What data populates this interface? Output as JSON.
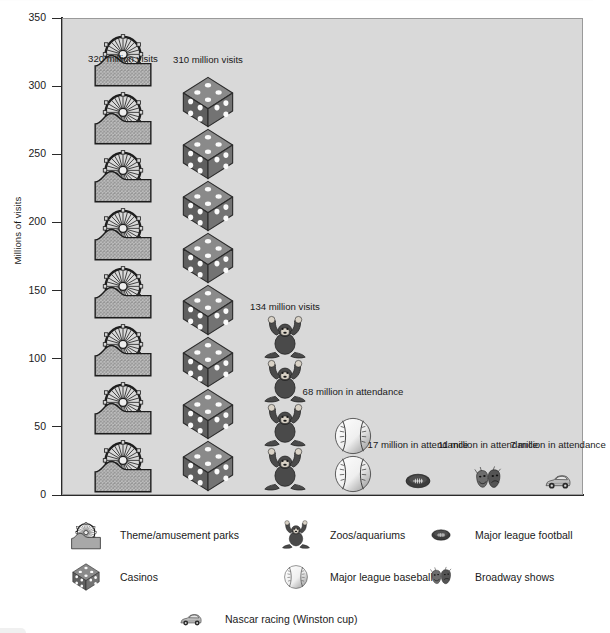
{
  "chart_data": {
    "type": "bar",
    "subtype": "pictograph",
    "title": "",
    "xlabel": "",
    "ylabel": "Millions of visits",
    "ylim": [
      0,
      350
    ],
    "yticks": [
      0,
      50,
      100,
      150,
      200,
      250,
      300,
      350
    ],
    "ytick_labels": [
      "0",
      "50",
      "100",
      "150",
      "200",
      "250",
      "300",
      "350"
    ],
    "grid": false,
    "legend_position": "bottom",
    "units_per_symbol": 40,
    "categories": [
      "Theme/amusement parks",
      "Casinos",
      "Zoos/aquariums",
      "Major league baseball",
      "Major league football",
      "Broadway shows",
      "Nascar racing (Winston cup)"
    ],
    "values": [
      320,
      310,
      134,
      68,
      17,
      11,
      7
    ],
    "value_labels": [
      "320 million visits",
      "310 million visits",
      "134 million visits",
      "68 million in attendance",
      "17 million in attendance",
      "11 million in attendance",
      "7 million in attendance"
    ],
    "series": [
      {
        "name": "Attendance",
        "values": [
          320,
          310,
          134,
          68,
          17,
          11,
          7
        ]
      }
    ]
  },
  "plot": {
    "background_color": "#d9d9d9",
    "axis_color": "#2a2a2a",
    "columns": [
      {
        "key": "theme-parks",
        "label": "320 million visits",
        "icon": "ferris-wheel-icon",
        "value": 320,
        "symbols": 8,
        "label_top_px": 52
      },
      {
        "key": "casinos",
        "label": "310 million visits",
        "icon": "dice-icon",
        "value": 310,
        "symbols": 8,
        "label_top_px": 53
      },
      {
        "key": "zoos",
        "label": "134 million visits",
        "icon": "gorilla-icon",
        "value": 134,
        "symbols": 4,
        "label_top_px": 300
      },
      {
        "key": "baseball",
        "label": "68 million in attendance",
        "icon": "baseball-icon",
        "value": 68,
        "symbols": 2,
        "label_top_px": 385
      },
      {
        "key": "football",
        "label": "17 million in attendance",
        "icon": "football-icon",
        "value": 17,
        "symbols": 1,
        "label_top_px": 438
      },
      {
        "key": "broadway",
        "label": "11 million in attendance",
        "icon": "theater-masks-icon",
        "value": 11,
        "symbols": 1,
        "label_top_px": 438
      },
      {
        "key": "nascar",
        "label": "7 million in attendance",
        "icon": "race-car-icon",
        "value": 7,
        "symbols": 1,
        "label_top_px": 438
      }
    ]
  },
  "legend": {
    "rows": [
      [
        {
          "icon": "ferris-wheel-icon",
          "label": "Theme/amusement parks"
        },
        {
          "icon": "gorilla-icon",
          "label": "Zoos/aquariums"
        },
        {
          "icon": "football-icon",
          "label": "Major league football"
        }
      ],
      [
        {
          "icon": "dice-icon",
          "label": "Casinos"
        },
        {
          "icon": "baseball-icon",
          "label": "Major league baseball"
        },
        {
          "icon": "theater-masks-icon",
          "label": "Broadway shows"
        }
      ],
      [
        {
          "icon": "race-car-icon",
          "label": "Nascar racing (Winston cup)"
        }
      ]
    ]
  },
  "colors": {
    "plot_background": "#d9d9d9",
    "page_background": "#ffffff",
    "ink": "#1a1a1a",
    "icon_dark": "#555555",
    "icon_mid": "#7d7d7d",
    "icon_light": "#b8b8b8"
  }
}
